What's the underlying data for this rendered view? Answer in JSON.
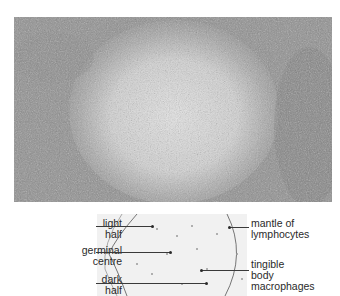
{
  "figure": {
    "micrograph": {
      "description": "light micrograph of lymphoid follicle with germinal centre"
    },
    "diagram": {
      "labels_left": [
        {
          "line1": "light",
          "line2": "half"
        },
        {
          "line1": "germinal",
          "line2": "centre"
        },
        {
          "line1": "dark",
          "line2": "half"
        }
      ],
      "labels_right": [
        {
          "line1": "mantle of",
          "line2": "lymphocytes"
        },
        {
          "line1": "tingible",
          "line2": "body",
          "line3": "macrophages"
        }
      ]
    },
    "colors": {
      "background": "#ffffff",
      "tissue_dark": "#7a7a7a",
      "tissue_light": "#d8d8d8",
      "text": "#2a2a2a"
    }
  }
}
